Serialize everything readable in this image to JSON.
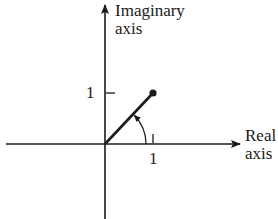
{
  "diagram": {
    "type": "complex-plane",
    "axes": {
      "imaginary": {
        "label_line1": "Imaginary",
        "label_line2": "axis"
      },
      "real": {
        "label_line1": "Real",
        "label_line2": "axis"
      }
    },
    "ticks": {
      "imaginary_tick_label": "1",
      "real_tick_label": "1"
    },
    "vector": {
      "from": [
        0,
        0
      ],
      "to": [
        1,
        1
      ],
      "endpoint": "filled-dot",
      "angle_arc": "counterclockwise arrow from real axis to vector"
    },
    "colors": {
      "ink": "#1a1a1a",
      "background": "#ffffff"
    }
  }
}
